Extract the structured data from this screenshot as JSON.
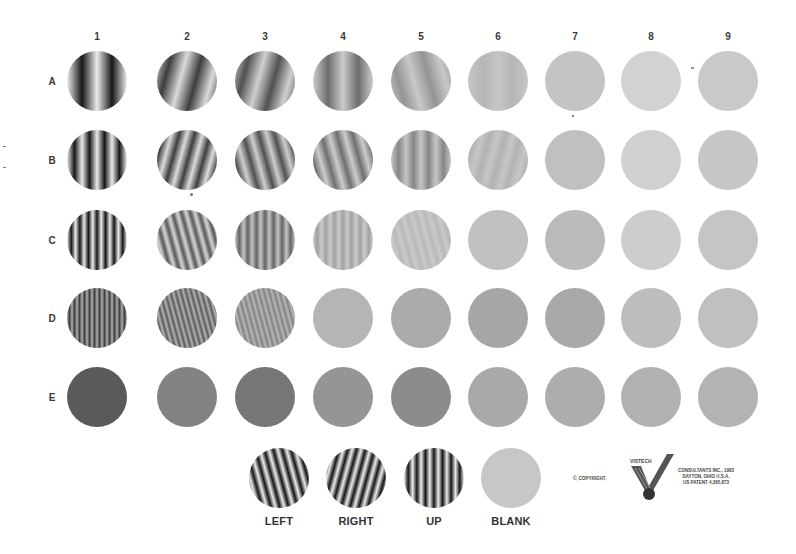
{
  "chart_title": "",
  "columns": [
    "1",
    "2",
    "3",
    "4",
    "5",
    "6",
    "7",
    "8",
    "9"
  ],
  "rows": [
    "A",
    "B",
    "C",
    "D",
    "E"
  ],
  "layout": {
    "col_x": [
      97,
      187,
      265,
      343,
      421,
      498,
      575,
      651,
      728
    ],
    "row_y": [
      81,
      160,
      240,
      318,
      397
    ],
    "col_label_y": 36,
    "row_label_x": 52,
    "radius": 30
  },
  "chart_data": {
    "type": "table",
    "columns": [
      "1",
      "2",
      "3",
      "4",
      "5",
      "6",
      "7",
      "8",
      "9"
    ],
    "rows": [
      {
        "row": "A",
        "cycles": 2,
        "patches": [
          {
            "col": "1",
            "orientation": "up",
            "contrast": 1.0,
            "bg": "#9c9c9c"
          },
          {
            "col": "2",
            "orientation": "right",
            "contrast": 0.75,
            "bg": "#a8a8a8"
          },
          {
            "col": "3",
            "orientation": "right",
            "contrast": 0.6,
            "bg": "#a6a6a6"
          },
          {
            "col": "4",
            "orientation": "up",
            "contrast": 0.45,
            "bg": "#b0b0b0"
          },
          {
            "col": "5",
            "orientation": "left",
            "contrast": 0.25,
            "bg": "#bcbcbc"
          },
          {
            "col": "6",
            "orientation": "up",
            "contrast": 0.08,
            "bg": "#c3c3c3"
          },
          {
            "col": "7",
            "orientation": "blank",
            "contrast": 0,
            "bg": "#c4c4c4"
          },
          {
            "col": "8",
            "orientation": "blank",
            "contrast": 0,
            "bg": "#d2d2d2"
          },
          {
            "col": "9",
            "orientation": "blank",
            "contrast": 0,
            "bg": "#c9c9c9"
          }
        ]
      },
      {
        "row": "B",
        "cycles": 4,
        "patches": [
          {
            "col": "1",
            "orientation": "up",
            "contrast": 1.0,
            "bg": "#9a9a9a"
          },
          {
            "col": "2",
            "orientation": "right",
            "contrast": 0.75,
            "bg": "#aaaaaa"
          },
          {
            "col": "3",
            "orientation": "left",
            "contrast": 0.6,
            "bg": "#a3a3a3"
          },
          {
            "col": "4",
            "orientation": "left",
            "contrast": 0.45,
            "bg": "#b3b3b3"
          },
          {
            "col": "5",
            "orientation": "up",
            "contrast": 0.3,
            "bg": "#b5b5b5"
          },
          {
            "col": "6",
            "orientation": "right",
            "contrast": 0.1,
            "bg": "#c2c2c2"
          },
          {
            "col": "7",
            "orientation": "blank",
            "contrast": 0,
            "bg": "#c0c0c0"
          },
          {
            "col": "8",
            "orientation": "blank",
            "contrast": 0,
            "bg": "#d0d0d0"
          },
          {
            "col": "9",
            "orientation": "blank",
            "contrast": 0,
            "bg": "#c6c6c6"
          }
        ]
      },
      {
        "row": "C",
        "cycles": 7,
        "patches": [
          {
            "col": "1",
            "orientation": "up",
            "contrast": 1.0,
            "bg": "#8c8c8c"
          },
          {
            "col": "2",
            "orientation": "left",
            "contrast": 0.6,
            "bg": "#b4b4b4"
          },
          {
            "col": "3",
            "orientation": "up",
            "contrast": 0.45,
            "bg": "#a2a2a2"
          },
          {
            "col": "4",
            "orientation": "up",
            "contrast": 0.2,
            "bg": "#c2c2c2"
          },
          {
            "col": "5",
            "orientation": "left",
            "contrast": 0.08,
            "bg": "#c6c6c6"
          },
          {
            "col": "6",
            "orientation": "blank",
            "contrast": 0,
            "bg": "#c1c1c1"
          },
          {
            "col": "7",
            "orientation": "blank",
            "contrast": 0,
            "bg": "#bababa"
          },
          {
            "col": "8",
            "orientation": "blank",
            "contrast": 0,
            "bg": "#cdcdcd"
          },
          {
            "col": "9",
            "orientation": "blank",
            "contrast": 0,
            "bg": "#c5c5c5"
          }
        ]
      },
      {
        "row": "D",
        "cycles": 12,
        "patches": [
          {
            "col": "1",
            "orientation": "up",
            "contrast": 0.5,
            "bg": "#6e6e6e"
          },
          {
            "col": "2",
            "orientation": "left",
            "contrast": 0.4,
            "bg": "#8a8a8a"
          },
          {
            "col": "3",
            "orientation": "left",
            "contrast": 0.25,
            "bg": "#a5a5a5"
          },
          {
            "col": "4",
            "orientation": "blank",
            "contrast": 0,
            "bg": "#b5b5b5"
          },
          {
            "col": "5",
            "orientation": "blank",
            "contrast": 0,
            "bg": "#ababab"
          },
          {
            "col": "6",
            "orientation": "blank",
            "contrast": 0,
            "bg": "#a6a6a6"
          },
          {
            "col": "7",
            "orientation": "blank",
            "contrast": 0,
            "bg": "#a9a9a9"
          },
          {
            "col": "8",
            "orientation": "blank",
            "contrast": 0,
            "bg": "#bdbdbd"
          },
          {
            "col": "9",
            "orientation": "blank",
            "contrast": 0,
            "bg": "#c0c0c0"
          }
        ]
      },
      {
        "row": "E",
        "cycles": 18,
        "patches": [
          {
            "col": "1",
            "orientation": "blank",
            "contrast": 0,
            "bg": "#5a5a5a"
          },
          {
            "col": "2",
            "orientation": "blank",
            "contrast": 0,
            "bg": "#838383"
          },
          {
            "col": "3",
            "orientation": "blank",
            "contrast": 0,
            "bg": "#767676"
          },
          {
            "col": "4",
            "orientation": "blank",
            "contrast": 0,
            "bg": "#959595"
          },
          {
            "col": "5",
            "orientation": "blank",
            "contrast": 0,
            "bg": "#8c8c8c"
          },
          {
            "col": "6",
            "orientation": "blank",
            "contrast": 0,
            "bg": "#a9a9a9"
          },
          {
            "col": "7",
            "orientation": "blank",
            "contrast": 0,
            "bg": "#adadad"
          },
          {
            "col": "8",
            "orientation": "blank",
            "contrast": 0,
            "bg": "#b1b1b1"
          },
          {
            "col": "9",
            "orientation": "blank",
            "contrast": 0,
            "bg": "#b3b3b3"
          }
        ]
      }
    ]
  },
  "samples": {
    "y": 478,
    "label_y": 521,
    "items": [
      {
        "label": "LEFT",
        "x": 279,
        "orientation": "left",
        "cycles": 7,
        "bg": "#8e8e8e"
      },
      {
        "label": "RIGHT",
        "x": 356,
        "orientation": "right",
        "cycles": 7,
        "bg": "#8e8e8e"
      },
      {
        "label": "UP",
        "x": 434,
        "orientation": "up",
        "cycles": 7,
        "bg": "#8a8a8a"
      },
      {
        "label": "BLANK",
        "x": 511,
        "orientation": "blank",
        "cycles": 0,
        "bg": "#c7c7c7"
      }
    ]
  },
  "footer": {
    "copyright": "©, COPYRIGHT,",
    "logo_text": "VISTECH",
    "company_line1": "CONSULTANTS INC., 1983",
    "company_line2": "DAYTON, OHIO  U.S.A.",
    "company_line3": "US PATENT 4,365,873"
  }
}
